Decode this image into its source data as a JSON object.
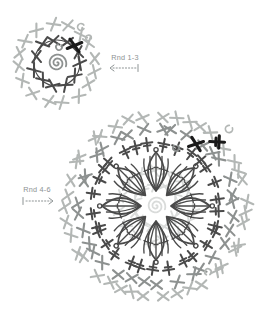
{
  "diagram": {
    "kind": "crochet-motif-chart",
    "colors": {
      "background": "#ffffff",
      "dark": "#4a4a4a",
      "mid": "#8d9190",
      "light": "#b3b7b5",
      "faded": "#d9dbda",
      "black": "#1a1a1a",
      "label": "#8d9394"
    },
    "labels": {
      "rnd13": {
        "text": "Rnd 1-3",
        "x": 125,
        "y": 60,
        "arrow": {
          "name": "rnd-1-3-arrow",
          "x1": 110,
          "x2": 138,
          "y": 68,
          "dir": "left"
        }
      },
      "rnd46": {
        "text": "Rnd 4-6",
        "x": 37,
        "y": 192,
        "arrow": {
          "name": "rnd-4-6-arrow",
          "x1": 23,
          "x2": 53,
          "y": 201,
          "dir": "right"
        }
      }
    },
    "small_motif": {
      "cx": 57,
      "cy": 63,
      "spiral": {
        "r": 9.5,
        "color": "mid",
        "w": 1.8
      },
      "rings": [
        {
          "name": "rnd2-sc-ring",
          "r": 23,
          "count": 11,
          "size": 5.6,
          "sw": 2.0,
          "color": "dark",
          "style": "x",
          "line": true,
          "lw": 1.15,
          "phase": -30
        },
        {
          "name": "rnd3-sc-ring",
          "r": 38.5,
          "count": 16,
          "size": 5.4,
          "sw": 2.1,
          "color": "light",
          "style": "x",
          "phase": -8
        }
      ],
      "markers": [
        {
          "x": 74.5,
          "y": 45.5,
          "rot": 16,
          "style": "x"
        }
      ],
      "chains": [
        {
          "x": 59,
          "y": 47,
          "r": 3.0,
          "color": "mid",
          "rot": -40
        },
        {
          "x": 81,
          "y": 27,
          "r": 3.4,
          "color": "light",
          "rot": 30
        },
        {
          "x": 88.5,
          "y": 38,
          "r": 2.8,
          "color": "light",
          "rot": 80
        }
      ]
    },
    "large_motif": {
      "cx": 156,
      "cy": 206,
      "spiral": {
        "r": 9.5,
        "color": "faded",
        "w": 1.8
      },
      "rings": [
        {
          "name": "faded-rnd2-ring",
          "r": 22,
          "count": 11,
          "size": 5.2,
          "sw": 1.9,
          "color": "faded",
          "style": "x",
          "line": true,
          "lw": 1.1,
          "phase": -30
        },
        {
          "name": "faded-rnd3-ring",
          "r": 36,
          "count": 15,
          "size": 5.2,
          "sw": 1.9,
          "color": "faded",
          "style": "x",
          "phase": 4
        },
        {
          "name": "rnd5-sc-ring",
          "r": 64,
          "count": 29,
          "size": 5.6,
          "sw": 2.0,
          "color": "dark",
          "style": "plus",
          "phase": -84
        },
        {
          "name": "rnd6-inner-ring",
          "r": 77.5,
          "count": 33,
          "size": 5.4,
          "sw": 2.1,
          "color": "mid",
          "style": "x",
          "phase": -77
        },
        {
          "name": "rnd6-outer-ring",
          "r": 90,
          "count": 39,
          "size": 5.3,
          "sw": 2.1,
          "color": "light",
          "style": "x",
          "phase": -70
        }
      ],
      "petals": {
        "count": 8,
        "phase": -90,
        "r0": 15,
        "r1": 54,
        "halfW": 8,
        "sw": 1.7,
        "color": "dark"
      },
      "markers": [
        {
          "x": 196,
          "y": 144,
          "rot": 20,
          "style": "x"
        },
        {
          "x": 219,
          "y": 142,
          "rot": 3,
          "style": "plus"
        }
      ],
      "chains": [
        {
          "x": 229,
          "y": 129,
          "r": 3.6,
          "color": "light",
          "rot": -20
        },
        {
          "x": 176,
          "y": 148,
          "r": 3.0,
          "color": "mid",
          "rot": -60
        },
        {
          "x": 208,
          "y": 272,
          "r": 3.2,
          "color": "light",
          "rot": 120
        }
      ]
    }
  }
}
